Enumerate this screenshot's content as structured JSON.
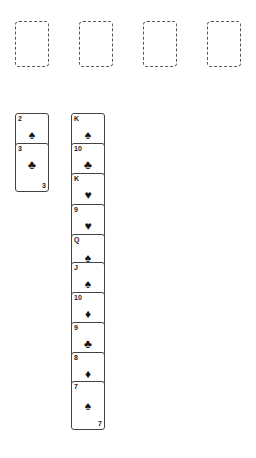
{
  "foundations": [
    {
      "label": "",
      "left": 15
    },
    {
      "label": "",
      "left": 79
    },
    {
      "label": "",
      "left": 143
    },
    {
      "label": "",
      "left": 207
    }
  ],
  "tableau": [
    {
      "left": 15,
      "cards": [
        {
          "rank": "2",
          "suit": "♠",
          "suit_name": "spades"
        },
        {
          "rank": "3",
          "suit": "♣",
          "suit_name": "clubs",
          "bottom_rank": "3"
        }
      ]
    },
    {
      "left": 71,
      "cards": [
        {
          "rank": "K",
          "suit": "♠",
          "suit_name": "spades"
        },
        {
          "rank": "10",
          "suit": "♣",
          "suit_name": "clubs"
        },
        {
          "rank": "K",
          "suit": "♥",
          "suit_name": "hearts"
        },
        {
          "rank": "9",
          "suit": "♥",
          "suit_name": "hearts"
        },
        {
          "rank": "Q",
          "suit": "♠",
          "suit_name": "spades"
        },
        {
          "rank": "J",
          "suit": "♠",
          "suit_name": "spades"
        },
        {
          "rank": "10",
          "suit": "♦",
          "suit_name": "diamonds"
        },
        {
          "rank": "9",
          "suit": "♣",
          "suit_name": "clubs"
        },
        {
          "rank": "8",
          "suit": "♦",
          "suit_name": "diamonds"
        },
        {
          "rank": "7",
          "suit": "♠",
          "suit_name": "spades",
          "bottom_rank": "7"
        }
      ]
    }
  ],
  "colors": {
    "card_border": "#444444",
    "card_face": "#ffffff",
    "suit": "#111111",
    "placeholder_border": "#555555"
  }
}
